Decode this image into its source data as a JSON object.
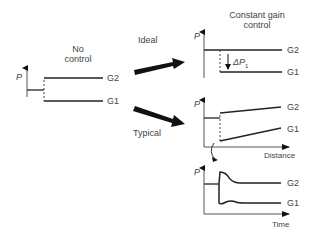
{
  "left_panel": {
    "title_line1": "No",
    "title_line2": "control",
    "axis_label": "P",
    "series_upper": "G2",
    "series_lower": "G1"
  },
  "arrows": {
    "ideal_label": "Ideal",
    "typical_label": "Typical"
  },
  "right_top": {
    "title_line1": "Constant gain",
    "title_line2": "control",
    "axis_label": "P",
    "delta_label": "ΔP",
    "delta_sub": "1",
    "series_upper": "G2",
    "series_lower": "G1"
  },
  "right_middle": {
    "axis_label": "P",
    "x_label": "Distance",
    "series_upper": "G2",
    "series_lower": "G1"
  },
  "right_bottom": {
    "axis_label": "P",
    "x_label": "Time",
    "series_upper": "G2",
    "series_lower": "G1"
  },
  "colors": {
    "line": "#1a1a1a",
    "text": "#444444"
  }
}
